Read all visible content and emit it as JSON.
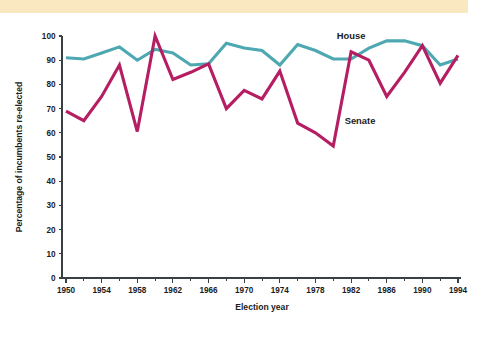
{
  "banner": {
    "color": "#fae9c0",
    "label": "top-color-band"
  },
  "chart_data": {
    "type": "line",
    "title": "",
    "subtitle": "",
    "xlabel": "Election year",
    "ylabel": "Percentage of incumbents re-elected",
    "xlim": [
      1949,
      1995
    ],
    "ylim": [
      0,
      100
    ],
    "y_ticks": [
      0,
      10,
      20,
      30,
      40,
      50,
      60,
      70,
      80,
      90,
      100
    ],
    "x_ticks_major": [
      1950,
      1954,
      1958,
      1962,
      1966,
      1970,
      1974,
      1978,
      1982,
      1986,
      1990,
      1994
    ],
    "x_ticks_minor": [
      1952,
      1956,
      1960,
      1964,
      1968,
      1972,
      1976,
      1980,
      1984,
      1988,
      1992
    ],
    "grid": false,
    "legend_position": "inline-annotations",
    "x": [
      1950,
      1952,
      1954,
      1956,
      1958,
      1960,
      1962,
      1964,
      1966,
      1968,
      1970,
      1972,
      1974,
      1976,
      1978,
      1980,
      1982,
      1984,
      1986,
      1988,
      1990,
      1992,
      1994
    ],
    "series": [
      {
        "name": "House",
        "color": "#4ea8b2",
        "values": [
          91,
          90.5,
          93,
          95.5,
          90,
          94.5,
          93,
          88,
          88.5,
          97,
          95,
          94,
          88,
          96.5,
          94,
          90.5,
          90.5,
          95,
          98,
          98,
          96,
          88,
          90.5
        ],
        "label_x": 1982,
        "label_y": 100,
        "label_text": "House"
      },
      {
        "name": "Senate",
        "color": "#b51e63",
        "values": [
          69,
          65,
          75,
          88,
          60.5,
          100,
          82,
          85,
          88.5,
          70,
          77.5,
          74,
          85.5,
          64,
          60,
          54.5,
          93.5,
          90,
          75,
          85,
          96,
          80.5,
          92
        ],
        "label_x": 1983,
        "label_y": 65,
        "label_text": "Senate"
      }
    ]
  }
}
